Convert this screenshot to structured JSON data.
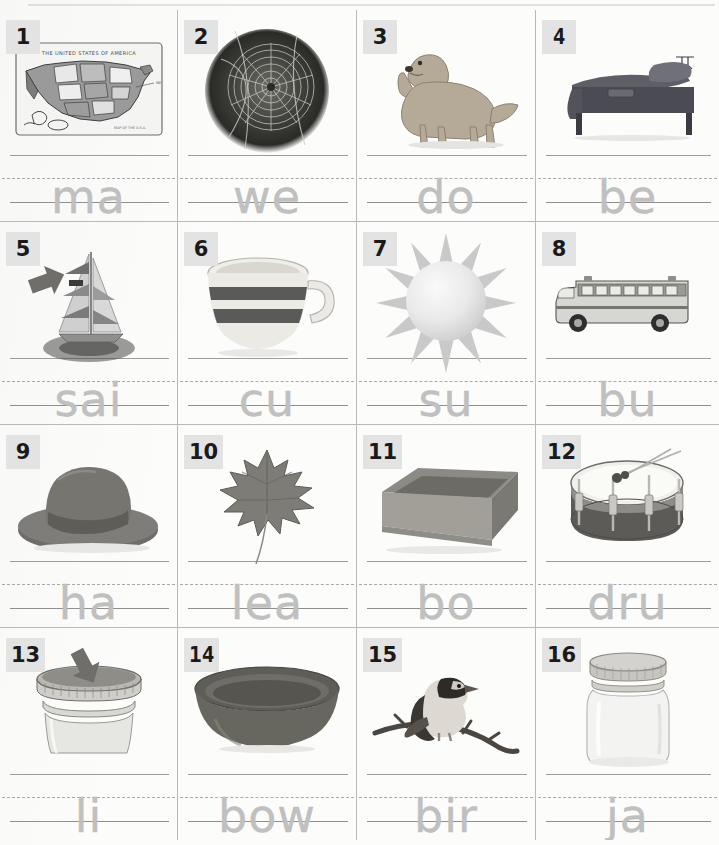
{
  "worksheet": {
    "columns": 4,
    "rows": 4,
    "paper_color": "#fcfcfb",
    "rule_color": "#b9b9b9",
    "badge_bg": "#e3e3e3",
    "trace_color": "#c0c0c0"
  },
  "cells": [
    {
      "number": "1",
      "icon": "us-map-picture",
      "word": "ma",
      "arrow": false
    },
    {
      "number": "2",
      "icon": "spider-web-photo",
      "word": "we",
      "arrow": false
    },
    {
      "number": "3",
      "icon": "dog-photo",
      "word": "do",
      "arrow": false
    },
    {
      "number": "4",
      "icon": "bed-photo",
      "word": "be",
      "arrow": false
    },
    {
      "number": "5",
      "icon": "sailboat-photo",
      "word": "sai",
      "arrow": true
    },
    {
      "number": "6",
      "icon": "cup-photo",
      "word": "cu",
      "arrow": false
    },
    {
      "number": "7",
      "icon": "sun-illustration",
      "word": "su",
      "arrow": false
    },
    {
      "number": "8",
      "icon": "school-bus-photo",
      "word": "bu",
      "arrow": false
    },
    {
      "number": "9",
      "icon": "hat-photo",
      "word": "ha",
      "arrow": false
    },
    {
      "number": "10",
      "icon": "maple-leaf-photo",
      "word": "lea",
      "arrow": false
    },
    {
      "number": "11",
      "icon": "box-photo",
      "word": "bo",
      "arrow": false
    },
    {
      "number": "12",
      "icon": "drum-photo",
      "word": "dru",
      "arrow": false
    },
    {
      "number": "13",
      "icon": "jar-lid-photo",
      "word": "li",
      "arrow": true
    },
    {
      "number": "14",
      "icon": "bowl-photo",
      "word": "bow",
      "arrow": false
    },
    {
      "number": "15",
      "icon": "bird-on-branch-photo",
      "word": "bir",
      "arrow": false
    },
    {
      "number": "16",
      "icon": "glass-jar-photo",
      "word": "ja",
      "arrow": false
    }
  ]
}
